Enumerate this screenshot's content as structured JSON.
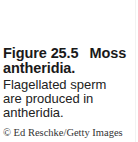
{
  "figure": {
    "label": "Figure 25.5",
    "title_word": "Moss",
    "title_rest": "antheridia.",
    "description": "Flagellated sperm are produced in antheridia.",
    "credit": "© Ed Reschke/Getty Images"
  }
}
